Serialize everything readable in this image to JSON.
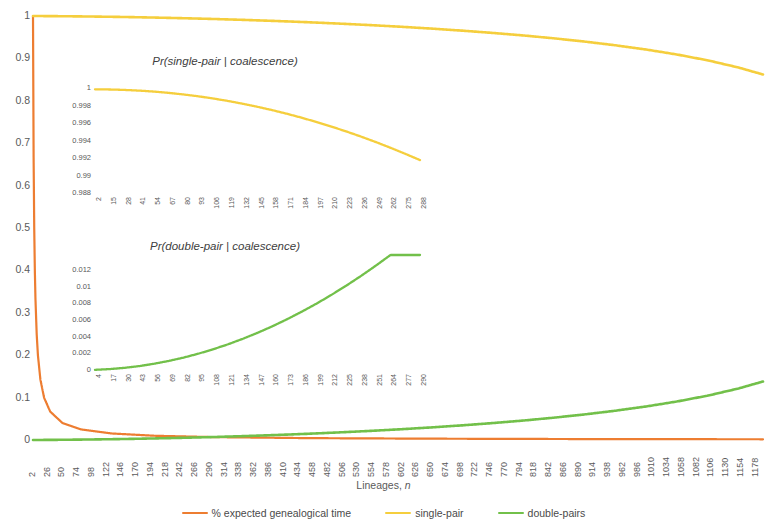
{
  "chart_data": {
    "type": "line",
    "title": "",
    "xlabel": "Lineages, n",
    "ylabel": "",
    "xlim": [
      2,
      1190
    ],
    "ylim": [
      0,
      1
    ],
    "grid": false,
    "legend_position": "bottom",
    "x_tick_labels": [
      "2",
      "26",
      "50",
      "74",
      "98",
      "122",
      "146",
      "170",
      "194",
      "218",
      "242",
      "266",
      "290",
      "314",
      "338",
      "362",
      "386",
      "410",
      "434",
      "458",
      "482",
      "506",
      "530",
      "554",
      "578",
      "602",
      "626",
      "650",
      "674",
      "698",
      "722",
      "746",
      "770",
      "794",
      "818",
      "842",
      "866",
      "890",
      "914",
      "938",
      "962",
      "986",
      "1010",
      "1034",
      "1058",
      "1082",
      "1106",
      "1130",
      "1154",
      "1178"
    ],
    "y_tick_labels": [
      "1",
      "0.9",
      "0.8",
      "0.7",
      "0.6",
      "0.5",
      "0.4",
      "0.3",
      "0.2",
      "0.1",
      "0"
    ],
    "series": [
      {
        "name": "% expected genealogical time",
        "color": "#ED7D31",
        "x": [
          2,
          3,
          4,
          5,
          6,
          8,
          10,
          14,
          20,
          30,
          50,
          80,
          130,
          200,
          300,
          450,
          650,
          900,
          1190
        ],
        "values": [
          1.0,
          0.667,
          0.5,
          0.4,
          0.333,
          0.25,
          0.2,
          0.143,
          0.1,
          0.067,
          0.04,
          0.025,
          0.0154,
          0.01,
          0.0067,
          0.0044,
          0.0031,
          0.0022,
          0.0017
        ]
      },
      {
        "name": "single-pair",
        "color": "#F5CE3D",
        "x": [
          2,
          50,
          100,
          150,
          200,
          250,
          300,
          350,
          400,
          450,
          500,
          550,
          600,
          650,
          700,
          750,
          800,
          850,
          900,
          950,
          1000,
          1050,
          1100,
          1150,
          1190
        ],
        "values": [
          1.0,
          0.9995,
          0.9987,
          0.9977,
          0.9963,
          0.9947,
          0.9928,
          0.9906,
          0.9881,
          0.9853,
          0.9821,
          0.9786,
          0.9747,
          0.9703,
          0.9655,
          0.9601,
          0.9541,
          0.9473,
          0.9396,
          0.9309,
          0.9209,
          0.9092,
          0.8954,
          0.8786,
          0.862
        ]
      },
      {
        "name": "double-pairs",
        "color": "#72C04A",
        "x": [
          2,
          50,
          100,
          150,
          200,
          250,
          300,
          350,
          400,
          450,
          500,
          550,
          600,
          650,
          700,
          750,
          800,
          850,
          900,
          950,
          1000,
          1050,
          1100,
          1150,
          1190
        ],
        "values": [
          0.0,
          0.0005,
          0.0013,
          0.0023,
          0.0037,
          0.0053,
          0.0072,
          0.0094,
          0.0119,
          0.0147,
          0.0179,
          0.0214,
          0.0253,
          0.0297,
          0.0345,
          0.0399,
          0.0459,
          0.0527,
          0.0604,
          0.0691,
          0.0791,
          0.0908,
          0.1046,
          0.1214,
          0.138
        ]
      }
    ],
    "legend": [
      {
        "label": "% expected genealogical time",
        "color": "#ED7D31"
      },
      {
        "label": "single-pair",
        "color": "#F5CE3D"
      },
      {
        "label": "double-pairs",
        "color": "#72C04A"
      }
    ],
    "insets": [
      {
        "id": "single",
        "type": "line",
        "title": "Pr(single-pair | coalescence)",
        "color": "#F5CE3D",
        "ylim": [
          0.988,
          1.0
        ],
        "y_tick_labels": [
          "1",
          "0.998",
          "0.996",
          "0.994",
          "0.992",
          "0.99",
          "0.988"
        ],
        "x_tick_labels": [
          "2",
          "15",
          "28",
          "41",
          "54",
          "67",
          "80",
          "93",
          "106",
          "119",
          "132",
          "145",
          "158",
          "171",
          "184",
          "197",
          "210",
          "223",
          "236",
          "249",
          "262",
          "275",
          "288"
        ],
        "x": [
          2,
          15,
          28,
          41,
          54,
          67,
          80,
          93,
          106,
          119,
          132,
          145,
          158,
          171,
          184,
          197,
          210,
          223,
          236,
          249,
          262,
          275,
          288
        ],
        "values": [
          0.99985,
          0.99983,
          0.99978,
          0.9997,
          0.99959,
          0.99944,
          0.99926,
          0.99905,
          0.9988,
          0.99852,
          0.9982,
          0.99785,
          0.99747,
          0.99705,
          0.9966,
          0.99611,
          0.99559,
          0.99504,
          0.99445,
          0.99383,
          0.99317,
          0.99248,
          0.99176
        ]
      },
      {
        "id": "double",
        "type": "line",
        "title": "Pr(double-pair | coalescence)",
        "color": "#72C04A",
        "ylim": [
          0,
          0.012
        ],
        "y_tick_labels": [
          "0.012",
          "0.01",
          "0.008",
          "0.006",
          "0.004",
          "0.002",
          "0"
        ],
        "x_tick_labels": [
          "4",
          "17",
          "30",
          "43",
          "56",
          "69",
          "82",
          "95",
          "108",
          "121",
          "134",
          "147",
          "160",
          "173",
          "186",
          "199",
          "212",
          "225",
          "238",
          "251",
          "264",
          "277",
          "290"
        ],
        "x": [
          4,
          17,
          30,
          43,
          56,
          69,
          82,
          95,
          108,
          121,
          134,
          147,
          160,
          173,
          186,
          199,
          212,
          225,
          238,
          251,
          264,
          277,
          290
        ],
        "values": [
          2e-05,
          0.00011,
          0.00026,
          0.00047,
          0.00075,
          0.00109,
          0.00149,
          0.00196,
          0.00249,
          0.00308,
          0.00374,
          0.00446,
          0.00524,
          0.00609,
          0.007,
          0.00797,
          0.00901,
          0.01011,
          0.01128,
          0.01251,
          0.0138,
          0.0138,
          0.0138
        ]
      }
    ]
  },
  "axis": {
    "x_title_prefix": "Lineages, ",
    "x_title_italic": "n"
  }
}
